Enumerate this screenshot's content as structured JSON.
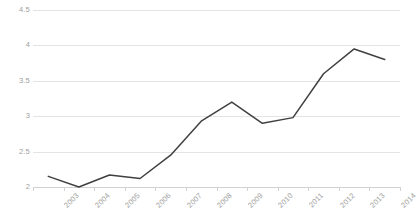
{
  "chart_data": {
    "type": "line",
    "title": "",
    "subtitle": "",
    "xlabel": "",
    "ylabel": "",
    "categories": [
      "2003",
      "2004",
      "2005",
      "2006",
      "2007",
      "2008",
      "2009",
      "2010",
      "2011",
      "2012",
      "2013",
      "2014"
    ],
    "series": [
      {
        "name": "",
        "values": [
          2.15,
          2.0,
          2.17,
          2.12,
          2.45,
          2.93,
          3.2,
          2.9,
          2.98,
          3.6,
          3.95,
          3.8
        ]
      }
    ],
    "ylim": [
      2,
      4.5
    ],
    "ytick_values": [
      4.5,
      4,
      3.5,
      3,
      2.5,
      2
    ],
    "ytick_labels": [
      "4.5",
      "4",
      "3.5",
      "3",
      "2.5",
      "2"
    ],
    "grid": "horizontal-only",
    "legend": "none",
    "line_color": "#404040",
    "grid_color": "#e4e4e4",
    "axis_color": "#d2d2d2",
    "tick_label_color": "#a0a0a0",
    "background_color": "#ffffff",
    "xlabel_rotation": -45,
    "markers": "none"
  }
}
